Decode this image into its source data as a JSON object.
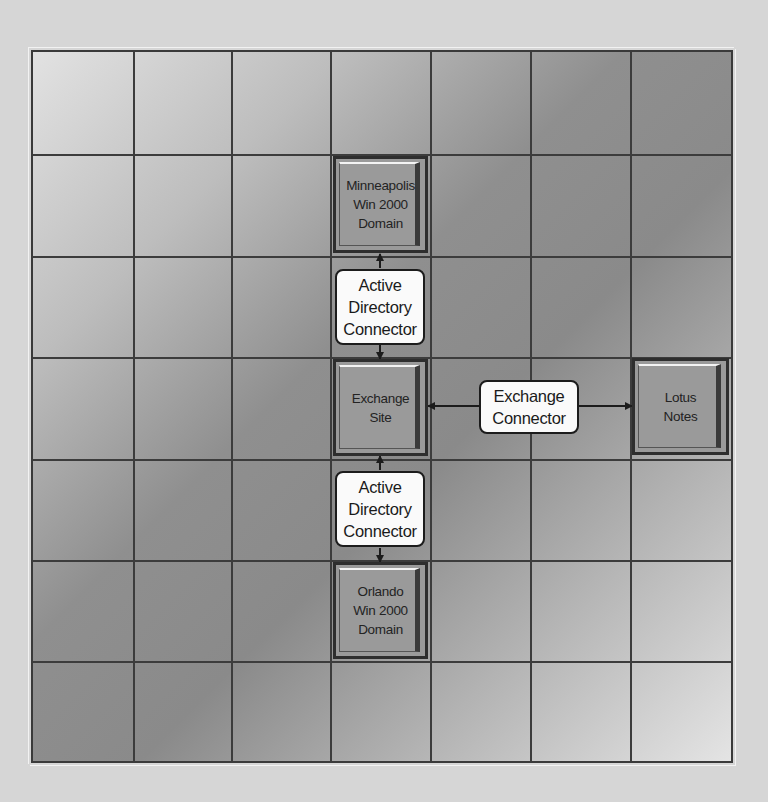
{
  "diagram": {
    "grid": {
      "rows": 7,
      "columns": 7
    },
    "nodes": [
      {
        "id": "minneapolis",
        "lines": [
          "Minneapolis",
          "Win 2000",
          "Domain"
        ],
        "row": 1,
        "col": 3
      },
      {
        "id": "exchange-site",
        "lines": [
          "Exchange",
          "Site"
        ],
        "row": 3,
        "col": 3
      },
      {
        "id": "orlando",
        "lines": [
          "Orlando",
          "Win 2000",
          "Domain"
        ],
        "row": 5,
        "col": 3
      },
      {
        "id": "lotus-notes",
        "lines": [
          "Lotus",
          "Notes"
        ],
        "row": 3,
        "col": 6
      }
    ],
    "connectors": [
      {
        "id": "ad-connector-top",
        "lines": [
          "Active",
          "Directory",
          "Connector"
        ],
        "between": [
          "minneapolis",
          "exchange-site"
        ]
      },
      {
        "id": "exchange-connector",
        "lines": [
          "Exchange",
          "Connector"
        ],
        "between": [
          "exchange-site",
          "lotus-notes"
        ]
      },
      {
        "id": "ad-connector-bottom",
        "lines": [
          "Active",
          "Directory",
          "Connector"
        ],
        "between": [
          "exchange-site",
          "orlando"
        ]
      }
    ],
    "colors": {
      "grid_line": "#3c3c3c",
      "node_fill": "#9a9a9a",
      "connector_fill": "#fafafa",
      "background": "#d6d6d6"
    }
  }
}
